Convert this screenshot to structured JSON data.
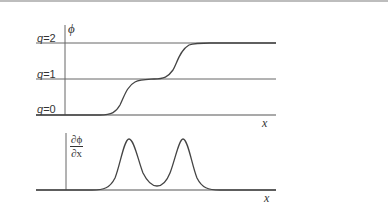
{
  "diagram": {
    "top_panel": {
      "y_axis_label": "ϕ",
      "x_axis_label": "x",
      "levels": [
        {
          "label_var": "q",
          "label_eq": "=2",
          "value": 2
        },
        {
          "label_var": "q",
          "label_eq": "=1",
          "value": 1
        },
        {
          "label_var": "q",
          "label_eq": "=0",
          "value": 0
        }
      ],
      "curve": "double kink staircase: 0 → 1 → 2"
    },
    "bottom_panel": {
      "y_axis_label_num": "∂ϕ",
      "y_axis_label_den": "∂x",
      "x_axis_label": "x",
      "curve": "two peaks at the kink positions"
    },
    "colors": {
      "line": "#555555",
      "curve": "#444444",
      "text": "#333333",
      "top_rule": "#bdbdbd"
    }
  }
}
